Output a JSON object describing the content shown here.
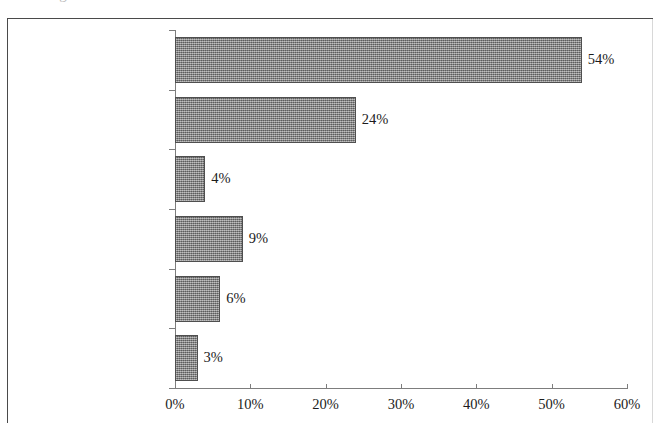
{
  "page": {
    "cut_off_title_fragment": "Umfrage: Dauer der Aufenthalte"
  },
  "chart_data": {
    "type": "bar",
    "orientation": "horizontal",
    "title": "",
    "xlabel": "",
    "ylabel": "",
    "categories": [
      "Freitagabend -\nSonntag",
      "Freitagabend -\nMontag",
      "Donnerstagabend -\nSonntag/Montag",
      "eine Woche und\nlänger",
      "sehr unterschiedlich",
      "Anderes"
    ],
    "values": [
      54,
      24,
      4,
      9,
      6,
      3
    ],
    "value_labels": [
      "54%",
      "24%",
      "4%",
      "9%",
      "6%",
      "3%"
    ],
    "xlim": [
      0,
      60
    ],
    "xticks": [
      0,
      10,
      20,
      30,
      40,
      50,
      60
    ],
    "xtick_labels": [
      "0%",
      "10%",
      "20%",
      "30%",
      "40%",
      "50%",
      "60%"
    ],
    "grid": false,
    "legend": null,
    "series_color": "#8a8a8a",
    "bar_border_color": "#4f4f4f",
    "axis_color": "#7d7d7d",
    "frame_color": "#4a4a4a",
    "text_color": "#1a1a1a"
  }
}
